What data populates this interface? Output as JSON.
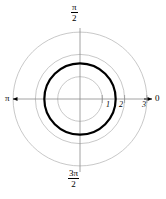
{
  "figure": {
    "background_color": "#ffffff",
    "width": 166,
    "height": 199
  },
  "axes": {
    "center": {
      "x": 80,
      "y": 99
    },
    "unit_px": 22.3,
    "angle_labels": {
      "right": "0",
      "top_numerator": "π",
      "top_denominator": "2",
      "left": "π",
      "bottom_numerator": "3π",
      "bottom_denominator": "2"
    },
    "radial_ticks": [
      {
        "value": "1",
        "r": 1
      },
      {
        "value": "2",
        "r": 2
      },
      {
        "value": "3",
        "r": 3
      }
    ],
    "axis_color": "#8c8c8c",
    "arrow_color": "#000000"
  },
  "chart_data": {
    "type": "line",
    "coordinate_system": "polar",
    "title": "",
    "xlabel": "",
    "ylabel": "",
    "grid": true,
    "grid_circles": [
      {
        "r": 1,
        "color": "#b0b0b0",
        "width": 0.7
      },
      {
        "r": 2,
        "color": "#b0b0b0",
        "width": 0.7
      },
      {
        "r": 3,
        "color": "#b0b0b0",
        "width": 0.7
      }
    ],
    "theta_ticks": [
      "0",
      "π/2",
      "π",
      "3π/2"
    ],
    "rlim": [
      0,
      3
    ],
    "rticks": [
      1,
      2,
      3
    ],
    "series": [
      {
        "name": "r = 1.6",
        "equation": "r = 1.6",
        "r_value": 1.6,
        "color": "#000000",
        "linewidth": 2.2,
        "closed": true
      }
    ]
  }
}
